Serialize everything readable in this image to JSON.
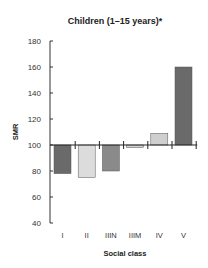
{
  "chart_data": {
    "type": "bar",
    "title": "Children (1–15 years)*",
    "xlabel": "Social class",
    "ylabel": "SMR",
    "categories": [
      "I",
      "II",
      "IIIN",
      "IIIM",
      "IV",
      "V"
    ],
    "values": [
      78,
      75,
      80,
      98,
      109,
      160
    ],
    "colors": [
      "#6a6a6a",
      "#dcdcdc",
      "#8a8a8a",
      "#d4d4d4",
      "#cfcfcf",
      "#6a6a6a"
    ],
    "baseline": 100,
    "ylim": [
      40,
      180
    ],
    "yticks": [
      40,
      60,
      80,
      100,
      120,
      140,
      160,
      180
    ],
    "grid": false,
    "legend": "none"
  }
}
